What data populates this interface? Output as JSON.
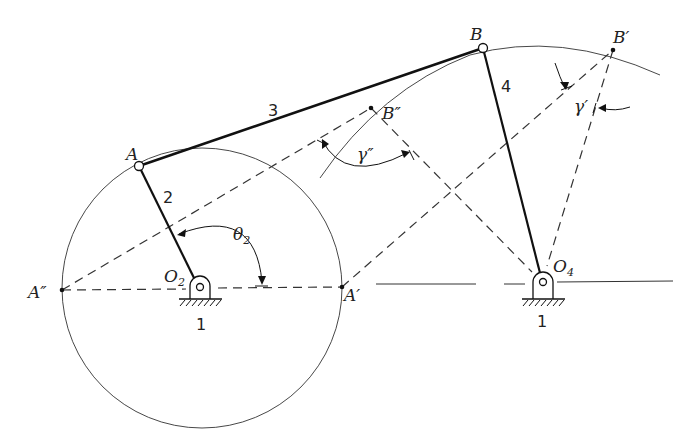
{
  "diagram": {
    "points": {
      "A": {
        "label": "A",
        "x": 139,
        "y": 166
      },
      "B": {
        "label": "B",
        "x": 483,
        "y": 48
      },
      "B_prime": {
        "label": "B′",
        "x": 613,
        "y": 50
      },
      "B_double_prime": {
        "label": "B″",
        "x": 371,
        "y": 108
      },
      "A_prime": {
        "label": "A′",
        "x": 342,
        "y": 288
      },
      "A_double_prime": {
        "label": "A″",
        "x": 62,
        "y": 290
      },
      "O2": {
        "label": "O",
        "sub": "2",
        "x": 202,
        "y": 289
      },
      "O4": {
        "label": "O",
        "sub": "4",
        "x": 540,
        "y": 282
      }
    },
    "links": [
      {
        "id": "2",
        "label": "2",
        "from": "O2",
        "to": "A"
      },
      {
        "id": "3",
        "label": "3",
        "from": "A",
        "to": "B"
      },
      {
        "id": "4",
        "label": "4",
        "from": "B",
        "to": "O4"
      }
    ],
    "ground_labels": [
      "1",
      "1"
    ],
    "angles": {
      "theta2": {
        "symbol": "θ",
        "sub": "2"
      },
      "gamma_prime": {
        "symbol": "γ′"
      },
      "gamma_double_prime": {
        "symbol": "γ″"
      }
    },
    "crank_circle": {
      "cx": 202,
      "cy": 289,
      "r": 140
    }
  }
}
